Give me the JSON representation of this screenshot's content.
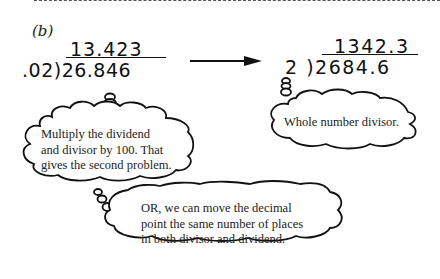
{
  "section_label": "(b)",
  "problem_original": {
    "quotient": "13.423",
    "divisor": ".02",
    "dividend": "26.846"
  },
  "problem_transformed": {
    "quotient": "1342.3",
    "divisor": "2",
    "dividend": "2684.6"
  },
  "arrow": "transform-arrow",
  "bubbles": [
    {
      "text": "Multiply the dividend\nand divisor by 100. That\ngives the second problem."
    },
    {
      "text": "Whole number divisor."
    },
    {
      "text": "OR, we can move the decimal\npoint the same number of places\nin both divisor and dividend."
    }
  ],
  "bubble_lines": {
    "b1": [
      "Multiply the dividend",
      "and divisor by 100. That",
      "gives the second problem."
    ],
    "b2": [
      "Whole number divisor."
    ],
    "b3": [
      "OR, we can move the decimal",
      "point the same number of places",
      "in both divisor and dividend."
    ]
  }
}
